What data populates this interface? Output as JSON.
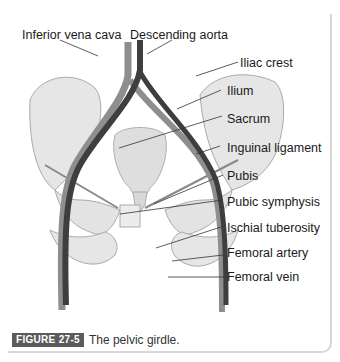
{
  "figure": {
    "title": "The pelvic girdle",
    "labels": [
      {
        "id": "inferior-vena-cava",
        "text": "Inferior vena cava"
      },
      {
        "id": "descending-aorta",
        "text": "Descending  aorta"
      },
      {
        "id": "iliac-crest",
        "text": "Iliac crest"
      },
      {
        "id": "ilium",
        "text": "Ilium"
      },
      {
        "id": "sacrum",
        "text": "Sacrum"
      },
      {
        "id": "inguinal-ligament",
        "text": "Inguinal ligament"
      },
      {
        "id": "pubis",
        "text": "Pubis"
      },
      {
        "id": "pubic-symphysis",
        "text": "Pubic symphysis"
      },
      {
        "id": "ischial-tuberosity",
        "text": "Ischial tuberosity"
      },
      {
        "id": "femoral-artery",
        "text": "Femoral artery"
      },
      {
        "id": "femoral-vein",
        "text": "Femoral vein"
      }
    ]
  },
  "caption": {
    "badge": "FIGURE 27-5",
    "text": "The pelvic girdle."
  },
  "colors": {
    "badge_bg": "#5b5b5b",
    "bone": "#e9e9e9",
    "artery": "#3a3a3a",
    "vein": "#8a8a8a"
  }
}
